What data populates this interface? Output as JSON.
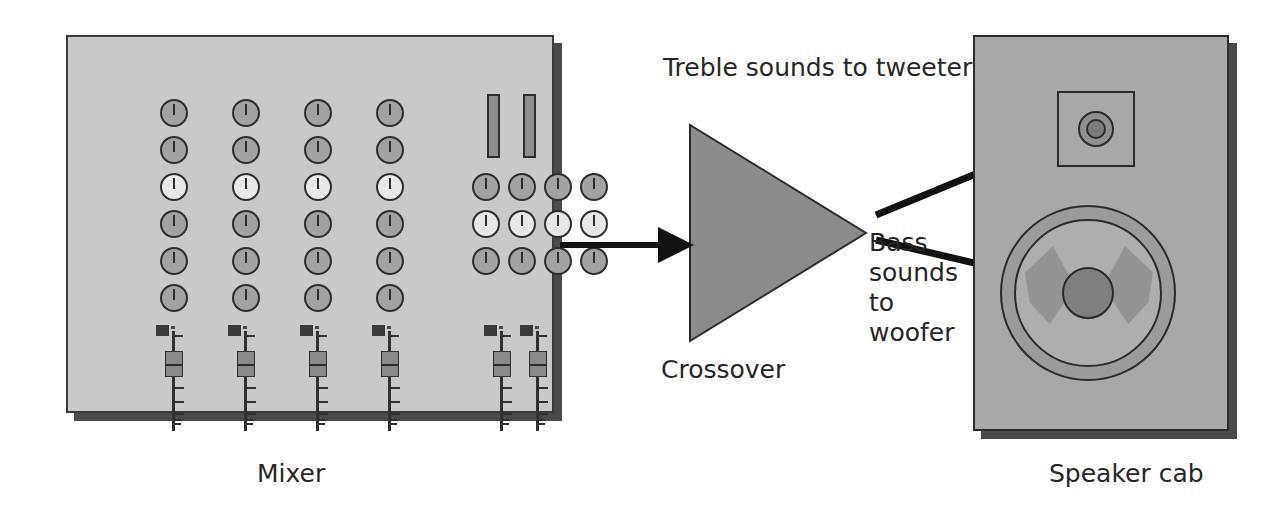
{
  "diagram": {
    "title_semantic": "audio-signal-flow-mixer-crossover-speaker",
    "labels": {
      "mixer": "Mixer",
      "crossover": "Crossover",
      "treble": "Treble sounds to tweeter",
      "bass": "Bass\nsounds\nto\nwoofer",
      "bass_lines": [
        "Bass",
        "sounds",
        "to",
        "woofer"
      ],
      "speaker_cab": "Speaker cab"
    },
    "colors": {
      "background": "#ffffff",
      "text": "#262626",
      "outline": "#2b2b2b",
      "mixer_panel": "#c9c9c9",
      "mixer_shadow": "#4a4a4a",
      "knob": "#a2a2a2",
      "knob_light": "#e8e8e8",
      "meter": "#8f8f8f",
      "fader_cap": "#8a8a8a",
      "crossover_fill": "#8b8b8b",
      "cab_body": "#a8a8a8",
      "cab_shadow": "#4a4a4a",
      "woofer_surround": "#9b9b9b",
      "woofer_cone": "#aeaeae",
      "woofer_dome": "#808080",
      "woofer_wing": "#949494",
      "tweeter_outer": "#919191",
      "tweeter_inner": "#7b7b7b",
      "arrow": "#111111"
    }
  },
  "mixer": {
    "knob_columns": [
      {
        "x": 92,
        "label": "channel-1"
      },
      {
        "x": 164,
        "label": "channel-2"
      },
      {
        "x": 236,
        "label": "channel-3"
      },
      {
        "x": 308,
        "label": "channel-4"
      }
    ],
    "knob_rows_y": [
      62,
      99,
      136,
      173,
      210,
      247
    ],
    "knob_light_row_index": 2,
    "master_grid": {
      "x_positions": [
        404,
        440,
        476,
        512
      ],
      "y_positions": [
        136,
        173,
        210
      ],
      "light_row_index": 1
    },
    "meters": [
      {
        "x": 419,
        "y": 57,
        "name": "vu-meter-left"
      },
      {
        "x": 455,
        "y": 57,
        "name": "vu-meter-right"
      }
    ],
    "faders": [
      {
        "x": 88,
        "y": 288,
        "name": "fader-channel-1"
      },
      {
        "x": 160,
        "y": 288,
        "name": "fader-channel-2"
      },
      {
        "x": 232,
        "y": 288,
        "name": "fader-channel-3"
      },
      {
        "x": 304,
        "y": 288,
        "name": "fader-channel-4"
      },
      {
        "x": 416,
        "y": 288,
        "name": "fader-master-left"
      },
      {
        "x": 452,
        "y": 288,
        "name": "fader-master-right"
      }
    ],
    "fader_ticks_y": [
      62,
      76,
      88,
      94,
      98
    ]
  },
  "flow": {
    "input_arrow": {
      "x1": 560,
      "y1": 245,
      "x2": 688,
      "y2": 245,
      "name": "mixer-to-crossover-arrow"
    },
    "treble_arrow": {
      "x1": 876,
      "y1": 215,
      "x2": 1080,
      "y2": 131,
      "name": "crossover-to-tweeter-arrow"
    },
    "bass_arrow": {
      "x1": 876,
      "y1": 240,
      "x2": 1098,
      "y2": 292,
      "name": "crossover-to-woofer-arrow"
    },
    "triangle_points": "0,0 0,216 176,108"
  }
}
